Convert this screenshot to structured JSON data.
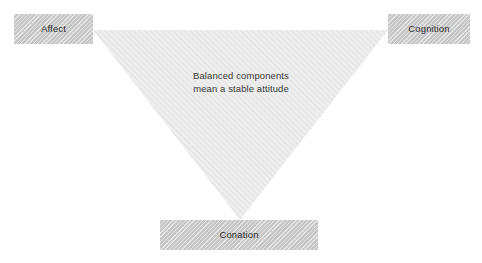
{
  "diagram": {
    "type": "tri-component attitude model",
    "background_color": "#ffffff",
    "node_fill_color": "#c6c6c6",
    "node_text_color": "#2d2d2d",
    "triangle_fill_color": "#ededed",
    "triangle_hatch_color": "#d8d8d8",
    "caption_text_color": "#3a3a3a",
    "nodes": [
      {
        "id": "affect",
        "label": "Affect",
        "position": "top-left"
      },
      {
        "id": "cognition",
        "label": "Cognition",
        "position": "top-right"
      },
      {
        "id": "conation",
        "label": "Conation",
        "position": "bottom-center"
      }
    ],
    "caption": {
      "line1": "Balanced components",
      "line2": "mean a stable attitude"
    },
    "triangle": {
      "orientation": "inverted",
      "vertices": [
        {
          "x": 93,
          "y": 30
        },
        {
          "x": 388,
          "y": 30
        },
        {
          "x": 240,
          "y": 220
        }
      ]
    }
  }
}
